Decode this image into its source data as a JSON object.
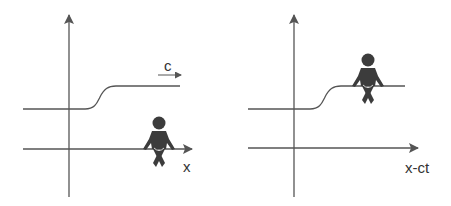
{
  "colors": {
    "stroke": "#555555",
    "figure": "#3c3c3c",
    "text": "#333333",
    "background": "#ffffff"
  },
  "panels": [
    {
      "id": "left",
      "x_axis_label": "x",
      "velocity_label": "c",
      "figure_position": "on x-axis, stationary frame",
      "curve": "smooth step rising from lower level to upper level"
    },
    {
      "id": "right",
      "x_axis_label": "x-ct",
      "figure_position": "on upper plateau of the wave, moving frame",
      "curve": "smooth step rising from lower level to upper level"
    }
  ]
}
